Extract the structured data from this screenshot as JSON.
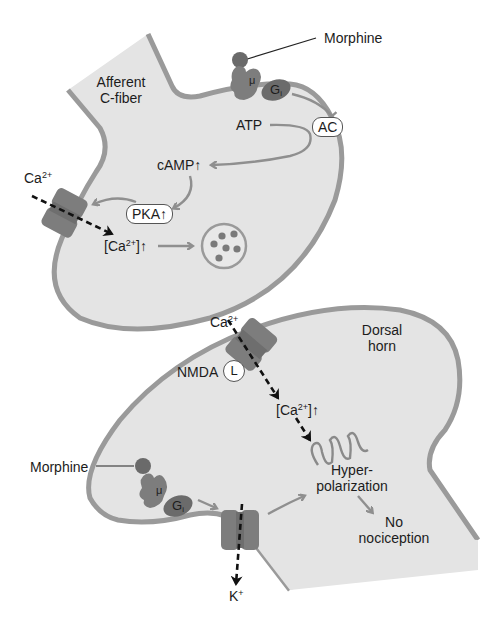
{
  "diagram": {
    "colors": {
      "cell_fill": "#e4e4e4",
      "membrane": "#9a9a9a",
      "protein": "#7d7d7d",
      "protein_dark": "#6b6b6b",
      "ligand": "#6a6a6a",
      "arrow": "#8f8f8f",
      "dashed_arrow": "#111111"
    },
    "presynaptic": {
      "cell_label_line1": "Afferent",
      "cell_label_line2": "C-fiber",
      "morphine_label": "Morphine",
      "receptor_label": "μ",
      "gprotein_label": "G",
      "gprotein_sub": "i",
      "enzyme_label": "AC",
      "substrate_label": "ATP",
      "second_messenger_label": "cAMP↑",
      "kinase_label": "PKA↑",
      "ion_label": "Ca",
      "ion_charge": "2+",
      "intracellular_ion_label": "[Ca",
      "intracellular_ion_charge": "2+",
      "intracellular_ion_suffix": "]↑"
    },
    "postsynaptic": {
      "cell_label_line1": "Dorsal",
      "cell_label_line2": "horn",
      "ion_label": "Ca",
      "ion_charge": "2+",
      "receptor_label": "NMDA",
      "ligand_label": "L",
      "intracellular_ion_label": "[Ca",
      "intracellular_ion_charge": "2+",
      "intracellular_ion_suffix": "]↑",
      "morphine_label": "Morphine",
      "mu_receptor_label": "μ",
      "gprotein_label": "G",
      "gprotein_sub": "i",
      "potassium_label": "K",
      "potassium_charge": "+",
      "effect_line1": "Hyper-",
      "effect_line2": "polarization",
      "outcome_line1": "No",
      "outcome_line2": "nociception"
    }
  }
}
